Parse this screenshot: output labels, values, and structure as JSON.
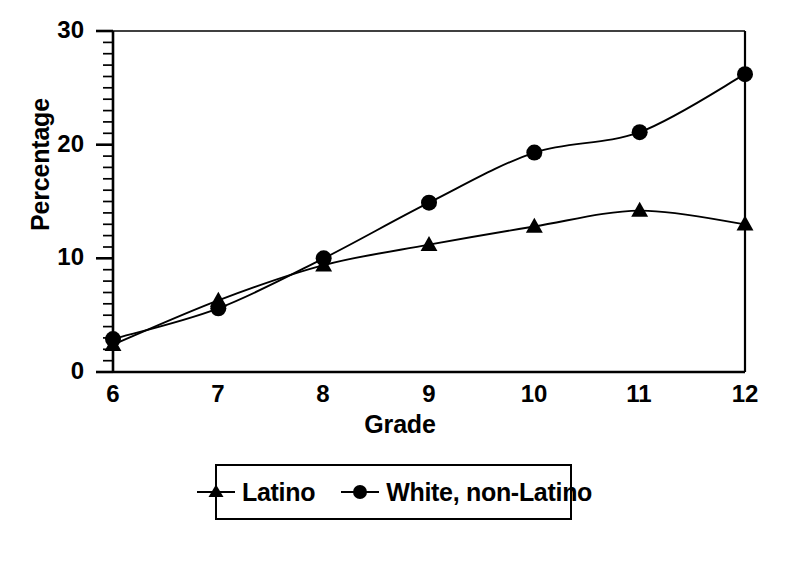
{
  "chart_data": {
    "type": "line",
    "title": "",
    "subtitle": "",
    "xlabel": "Grade",
    "ylabel": "Percentage",
    "x": [
      6,
      7,
      8,
      9,
      10,
      11,
      12
    ],
    "categories": [
      "6",
      "7",
      "8",
      "9",
      "10",
      "11",
      "12"
    ],
    "xlim": [
      6,
      12
    ],
    "ylim": [
      0,
      30
    ],
    "ytick_labels": [
      "0",
      "10",
      "20",
      "30"
    ],
    "yticks": [
      0,
      10,
      20,
      30
    ],
    "ytick_minor_step": 1,
    "xtick_labels": [
      "6",
      "7",
      "8",
      "9",
      "10",
      "11",
      "12"
    ],
    "grid": false,
    "legend_position": "below-center",
    "series": [
      {
        "name": "Latino",
        "marker": "triangle",
        "color": "#000000",
        "values": [
          2.4,
          6.3,
          9.4,
          11.2,
          12.8,
          14.2,
          13.0
        ]
      },
      {
        "name": "White, non-Latino",
        "marker": "circle",
        "color": "#000000",
        "values": [
          2.9,
          5.6,
          10.0,
          14.9,
          19.3,
          21.1,
          26.2
        ]
      }
    ],
    "annotations": []
  },
  "axes": {
    "y_title": "Percentage",
    "x_title": "Grade",
    "y_tick_0": "0",
    "y_tick_1": "10",
    "y_tick_2": "20",
    "y_tick_3": "30",
    "x_tick_0": "6",
    "x_tick_1": "7",
    "x_tick_2": "8",
    "x_tick_3": "9",
    "x_tick_4": "10",
    "x_tick_5": "11",
    "x_tick_6": "12"
  },
  "legend": {
    "entries": [
      {
        "label": "Latino",
        "marker": "triangle"
      },
      {
        "label": "White, non-Latino",
        "marker": "circle"
      }
    ]
  },
  "colors": {
    "ink": "#000000",
    "background": "#ffffff"
  }
}
